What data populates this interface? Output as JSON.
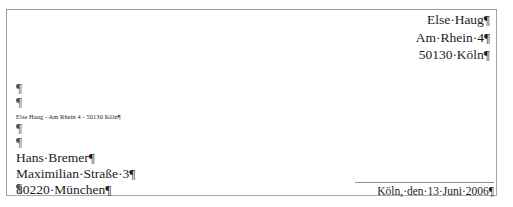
{
  "document": {
    "type": "letter",
    "language": "de",
    "formatting_marks_visible": true,
    "paragraph_mark_glyph": "¶",
    "space_dot_glyph": "·",
    "border_color": "#a8a8a8",
    "text_color": "#1c1c1c",
    "rule_color": "#8f8f8f"
  },
  "sender_block": {
    "alignment": "right",
    "lines": [
      "Else·Haug¶",
      "Am·Rhein·4¶",
      "50130·Köln¶"
    ]
  },
  "empty_paragraphs_top": [
    "¶",
    "¶"
  ],
  "return_address_line": {
    "text": "Else Haug - Am Rhein 4 - 50130 Köln¶",
    "style": "small"
  },
  "empty_paragraphs_mid": [
    "¶"
  ],
  "recipient_block": {
    "alignment": "left",
    "lines": [
      "¶",
      "Hans·Bremer¶",
      "Maximilian·Straße·3¶",
      "80220·München¶"
    ]
  },
  "empty_paragraphs_bottom": [
    "¶"
  ],
  "date_line": {
    "text": "Köln,·den·13·Juni·2006¶",
    "alignment": "right",
    "has_rule_above": true
  }
}
